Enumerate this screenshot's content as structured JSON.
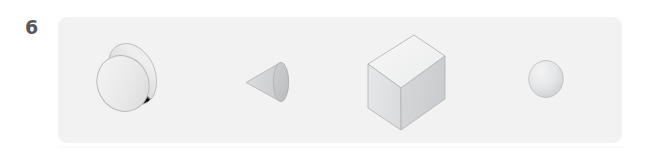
{
  "worksheet": {
    "question_number": "6",
    "panel": {
      "name": "shape-row-panel",
      "fill_color": "#f2f2f2",
      "corner_radius_px": 9
    },
    "page_background": "#ffffff",
    "number_color": "#58585a"
  },
  "shapes": [
    {
      "id": "shape-1",
      "name": "cylinder",
      "label": "cylinder",
      "orientation": "tilted, lying on its side, circular face toward lower-left",
      "faces_visible": [
        "circular end face",
        "curved lateral surface"
      ],
      "fill_light": "#f0f0f1",
      "fill_dark": "#c9cacb",
      "stroke_color": "#b9babc",
      "box": {
        "x": 88,
        "y": 38,
        "w": 74,
        "h": 78
      }
    },
    {
      "id": "shape-2",
      "name": "cone",
      "label": "cone",
      "orientation": "lying on its side, apex pointing left, circular base on right",
      "faces_visible": [
        "elliptical base",
        "curved lateral surface"
      ],
      "fill_light": "#e4e5e6",
      "fill_dark": "#c4c5c7",
      "stroke_color": "#b5b6b8",
      "box": {
        "x": 247,
        "y": 63,
        "w": 46,
        "h": 39
      }
    },
    {
      "id": "shape-3",
      "name": "cube",
      "label": "cube",
      "orientation": "isometric view, top / left / right faces visible",
      "faces_visible": [
        "top face",
        "left face",
        "right face"
      ],
      "fill_top": "#f4f4f5",
      "fill_left": "#e2e3e4",
      "fill_right": "#d3d4d6",
      "stroke_color": "#b5b6b8",
      "box": {
        "x": 368,
        "y": 34,
        "w": 78,
        "h": 94
      }
    },
    {
      "id": "shape-4",
      "name": "sphere",
      "label": "sphere",
      "orientation": "front view, highlight upper-left",
      "faces_visible": [
        "curved surface"
      ],
      "fill_light": "#f1f1f2",
      "fill_dark": "#c8c9cb",
      "stroke_color": "#bdbec0",
      "box": {
        "x": 529,
        "y": 61,
        "w": 34,
        "h": 37
      }
    }
  ]
}
